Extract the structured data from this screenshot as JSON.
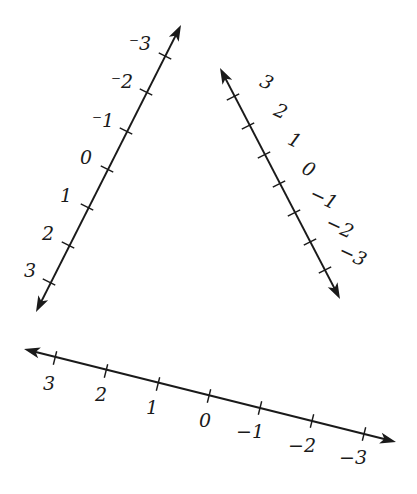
{
  "diagram": {
    "stroke_color": "#1a1a1a",
    "number_lines": [
      {
        "id": "left-line",
        "start": [
          36,
          312
        ],
        "end": [
          181,
          25
        ],
        "arrows": [
          "start",
          "end"
        ],
        "ticks": [
          {
            "label": "3",
            "pos": [
              49,
              282
            ],
            "label_pos": [
              30,
              277
            ],
            "rotate": 0
          },
          {
            "label": "2",
            "pos": [
              68,
              245
            ],
            "label_pos": [
              48,
              240
            ],
            "rotate": 0
          },
          {
            "label": "1",
            "pos": [
              87,
              207
            ],
            "label_pos": [
              66,
              202
            ],
            "rotate": 0
          },
          {
            "label": "0",
            "pos": [
              107,
              169
            ],
            "label_pos": [
              86,
              164
            ],
            "rotate": 0
          },
          {
            "label": "⁻1",
            "pos": [
              126,
              131
            ],
            "label_pos": [
              103,
              127
            ],
            "rotate": 0
          },
          {
            "label": "⁻2",
            "pos": [
              146,
              92
            ],
            "label_pos": [
              122,
              88
            ],
            "rotate": 0
          },
          {
            "label": "⁻3",
            "pos": [
              165,
              56
            ],
            "label_pos": [
              140,
              50
            ],
            "rotate": 0
          }
        ]
      },
      {
        "id": "right-line",
        "start": [
          220,
          68
        ],
        "end": [
          340,
          299
        ],
        "arrows": [
          "start",
          "end"
        ],
        "ticks": [
          {
            "label": "3",
            "pos": [
              233,
              97
            ],
            "label_pos": [
              264,
              88
            ],
            "rotate": 25
          },
          {
            "label": "2",
            "pos": [
              248,
              126
            ],
            "label_pos": [
              278,
              117
            ],
            "rotate": 25
          },
          {
            "label": "1",
            "pos": [
              264,
              155
            ],
            "label_pos": [
              292,
              146
            ],
            "rotate": 25
          },
          {
            "label": "0",
            "pos": [
              279,
              184
            ],
            "label_pos": [
              306,
              175
            ],
            "rotate": 25
          },
          {
            "label": "−1",
            "pos": [
              294,
              213
            ],
            "label_pos": [
              321,
              204
            ],
            "rotate": 25
          },
          {
            "label": "−2",
            "pos": [
              310,
              242
            ],
            "label_pos": [
              337,
              233
            ],
            "rotate": 25
          },
          {
            "label": "−3",
            "pos": [
              325,
              270
            ],
            "label_pos": [
              350,
              261
            ],
            "rotate": 25
          }
        ]
      },
      {
        "id": "bottom-line",
        "start": [
          24,
          349
        ],
        "end": [
          396,
          442
        ],
        "arrows": [
          "start",
          "end"
        ],
        "ticks": [
          {
            "label": "3",
            "pos": [
              55,
              358
            ],
            "label_pos": [
              49,
              390
            ],
            "rotate": 0
          },
          {
            "label": "2",
            "pos": [
              106,
              371
            ],
            "label_pos": [
              101,
              401
            ],
            "rotate": 0
          },
          {
            "label": "1",
            "pos": [
              158,
              384
            ],
            "label_pos": [
              152,
              414
            ],
            "rotate": 0
          },
          {
            "label": "0",
            "pos": [
              209,
              396
            ],
            "label_pos": [
              205,
              427
            ],
            "rotate": 0
          },
          {
            "label": "−1",
            "pos": [
              260,
              408
            ],
            "label_pos": [
              250,
              438
            ],
            "rotate": 0
          },
          {
            "label": "−2",
            "pos": [
              312,
              421
            ],
            "label_pos": [
              302,
              452
            ],
            "rotate": 0
          },
          {
            "label": "−3",
            "pos": [
              364,
              434
            ],
            "label_pos": [
              353,
              464
            ],
            "rotate": 0
          }
        ]
      }
    ]
  }
}
